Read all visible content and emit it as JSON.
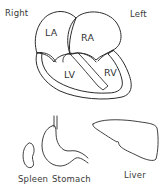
{
  "figure": {
    "orientation": {
      "right_label": "Right",
      "left_label": "Left"
    },
    "heart": {
      "chambers": [
        {
          "id": "la",
          "label": "LA"
        },
        {
          "id": "ra",
          "label": "RA"
        },
        {
          "id": "lv",
          "label": "LV"
        },
        {
          "id": "rv",
          "label": "RV"
        }
      ]
    },
    "abdominal_organs": [
      {
        "id": "spleen",
        "label": "Spleen"
      },
      {
        "id": "stomach",
        "label": "Stomach"
      },
      {
        "id": "liver",
        "label": "Liver"
      }
    ],
    "colors": {
      "line": "#2b2b2b",
      "background": "#ffffff"
    }
  }
}
